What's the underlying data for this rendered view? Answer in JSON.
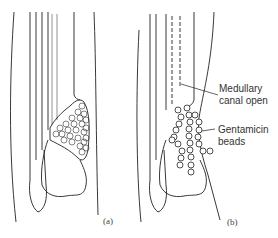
{
  "figure": {
    "panels": [
      {
        "id": "a",
        "caption": "(a)"
      },
      {
        "id": "b",
        "caption": "(b)"
      }
    ],
    "annotations": {
      "medullary_line1": "Medullary",
      "medullary_line2": "canal open",
      "gentamicin_line1": "Gentamicin",
      "gentamicin_line2": "beads"
    },
    "colors": {
      "line": "#222222",
      "background": "#ffffff"
    }
  }
}
